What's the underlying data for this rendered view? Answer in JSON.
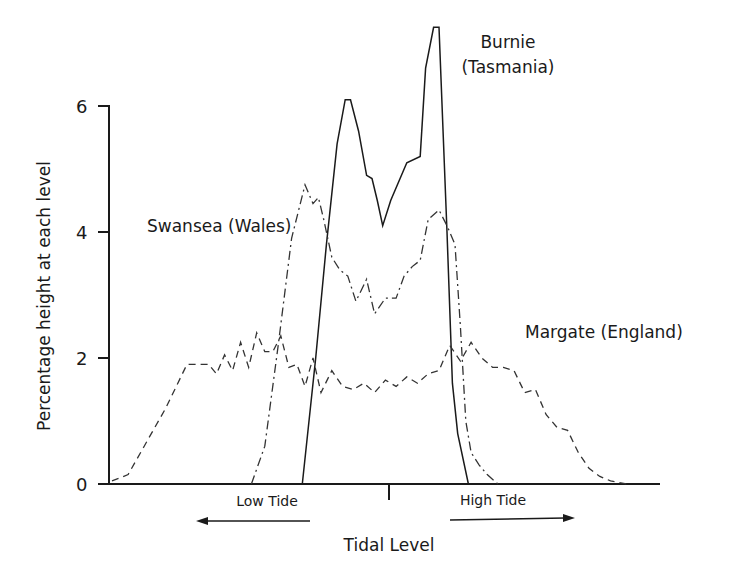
{
  "chart_data": {
    "type": "line",
    "title": "",
    "xlabel": "Tidal Level",
    "ylabel": "Percentage height at each level",
    "ylim": [
      0,
      7.3
    ],
    "yticks": [
      0,
      2,
      4,
      6
    ],
    "ytick_labels": [
      "0",
      "2",
      "4",
      "6"
    ],
    "grid": false,
    "legend": "inline labels",
    "x_annotations": {
      "low_tide": "Low Tide",
      "high_tide": "High Tide",
      "low_arrow_direction": "left",
      "high_arrow_direction": "right"
    },
    "x_note": "x is relative tidal level from low (0) to high (100); center tick at 50",
    "series": [
      {
        "name": "Burnie (Tasmania)",
        "label_line1": "Burnie",
        "label_line2": "(Tasmania)",
        "style": "solid",
        "x": [
          35.5,
          38,
          40,
          42,
          43.5,
          44.5,
          46,
          47.5,
          48.5,
          49.5,
          50.5,
          52,
          55,
          57.5,
          58.5,
          60,
          61,
          62.5,
          63.5,
          64.5,
          66.5
        ],
        "values": [
          0,
          2.0,
          3.8,
          5.4,
          6.1,
          6.1,
          5.6,
          4.9,
          4.85,
          4.5,
          4.1,
          4.5,
          5.1,
          5.2,
          6.6,
          7.25,
          7.25,
          4.0,
          1.6,
          0.8,
          0
        ]
      },
      {
        "name": "Swansea (Wales)",
        "label": "Swansea (Wales)",
        "style": "dash-dot",
        "x": [
          26,
          28.5,
          31,
          33.5,
          36,
          37.5,
          38.5,
          39.5,
          41,
          42.5,
          44,
          45.5,
          47.5,
          49,
          51,
          53,
          54.5,
          56,
          57.5,
          59,
          61,
          62.5,
          64,
          65,
          66,
          67,
          68.5,
          70,
          72
        ],
        "values": [
          0,
          0.6,
          2.2,
          3.9,
          4.75,
          4.45,
          4.55,
          4.2,
          3.6,
          3.4,
          3.3,
          2.9,
          3.25,
          2.7,
          2.95,
          2.95,
          3.3,
          3.45,
          3.55,
          4.2,
          4.35,
          4.1,
          3.8,
          2.5,
          1.0,
          0.5,
          0.3,
          0.15,
          0
        ]
      },
      {
        "name": "Margate (England)",
        "label": "Margate (England)",
        "style": "dashed",
        "x": [
          0,
          3,
          6,
          10,
          14,
          18,
          19.5,
          21,
          22.5,
          24,
          25.5,
          27,
          28.5,
          30,
          31.5,
          33,
          34.5,
          36,
          37.5,
          39,
          41,
          43,
          45,
          47,
          49,
          51,
          53,
          55,
          57,
          59,
          61,
          63,
          65,
          67,
          69,
          71,
          73,
          75,
          77,
          79,
          81,
          83,
          85,
          87,
          89,
          91,
          93,
          96
        ],
        "values": [
          0.05,
          0.15,
          0.6,
          1.2,
          1.9,
          1.9,
          1.75,
          2.05,
          1.8,
          2.25,
          1.85,
          2.4,
          2.1,
          2.1,
          2.35,
          1.85,
          1.9,
          1.55,
          2.0,
          1.45,
          1.8,
          1.55,
          1.5,
          1.6,
          1.45,
          1.65,
          1.55,
          1.7,
          1.6,
          1.75,
          1.8,
          2.2,
          1.95,
          2.25,
          2.0,
          1.85,
          1.85,
          1.8,
          1.45,
          1.5,
          1.1,
          0.9,
          0.85,
          0.5,
          0.25,
          0.12,
          0.05,
          0
        ]
      }
    ]
  },
  "colors": {
    "line": "#1a1a1a",
    "background": "#ffffff"
  }
}
